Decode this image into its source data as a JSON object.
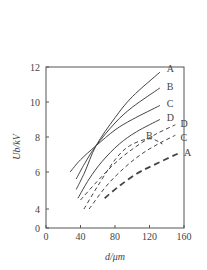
{
  "chart_data": {
    "type": "line",
    "title": "",
    "xlabel": "d/μm",
    "ylabel": "U_b/kV",
    "xlim": [
      0,
      160
    ],
    "ylim": [
      0,
      12
    ],
    "y_axis_break": "between 0 and 4",
    "grid": false,
    "legend": "inline labels at curve ends",
    "x_ticks": [
      0,
      40,
      80,
      120,
      160
    ],
    "y_ticks": [
      0,
      4,
      6,
      8,
      10,
      12
    ],
    "series": [
      {
        "name": "A",
        "style": "solid",
        "points": [
          [
            35,
            5.0
          ],
          [
            45,
            6.0
          ],
          [
            58,
            7.5
          ],
          [
            80,
            9.1
          ],
          [
            100,
            10.3
          ],
          [
            132,
            11.7
          ]
        ],
        "label_at": [
          140,
          11.9
        ]
      },
      {
        "name": "B",
        "style": "solid",
        "points": [
          [
            35,
            5.6
          ],
          [
            45,
            6.5
          ],
          [
            58,
            7.5
          ],
          [
            80,
            8.8
          ],
          [
            100,
            9.7
          ],
          [
            132,
            10.8
          ]
        ],
        "label_at": [
          140,
          10.9
        ]
      },
      {
        "name": "C",
        "style": "solid",
        "points": [
          [
            28,
            6.0
          ],
          [
            40,
            6.7
          ],
          [
            58,
            7.5
          ],
          [
            80,
            8.4
          ],
          [
            100,
            9.0
          ],
          [
            132,
            9.8
          ]
        ],
        "label_at": [
          140,
          9.9
        ]
      },
      {
        "name": "D",
        "style": "solid",
        "points": [
          [
            37,
            4.5
          ],
          [
            50,
            5.6
          ],
          [
            65,
            6.6
          ],
          [
            85,
            7.6
          ],
          [
            105,
            8.3
          ],
          [
            132,
            9.0
          ]
        ],
        "label_at": [
          140,
          9.1
        ]
      },
      {
        "name": "D",
        "style": "dashed",
        "points": [
          [
            40,
            4.4
          ],
          [
            60,
            5.5
          ],
          [
            80,
            6.5
          ],
          [
            100,
            7.3
          ],
          [
            125,
            8.1
          ],
          [
            150,
            8.7
          ]
        ],
        "label_at": [
          156,
          8.8
        ]
      },
      {
        "name": "B",
        "style": "dashed",
        "points": [
          [
            44,
            3.7
          ],
          [
            60,
            5.2
          ],
          [
            80,
            6.7
          ],
          [
            97,
            7.5
          ],
          [
            120,
            7.9
          ],
          [
            135,
            7.6
          ]
        ],
        "label_at": [
          116,
          8.1
        ]
      },
      {
        "name": "C",
        "style": "dashed",
        "points": [
          [
            50,
            3.7
          ],
          [
            70,
            5.2
          ],
          [
            90,
            6.2
          ],
          [
            110,
            7.0
          ],
          [
            130,
            7.6
          ],
          [
            150,
            8.1
          ]
        ],
        "label_at": [
          156,
          8.0
        ]
      },
      {
        "name": "A",
        "style": "dashed-bold",
        "points": [
          [
            68,
            4.5
          ],
          [
            85,
            5.2
          ],
          [
            105,
            5.9
          ],
          [
            125,
            6.4
          ],
          [
            155,
            7.1
          ]
        ],
        "label_at": [
          160,
          7.1
        ]
      }
    ]
  },
  "labels": {
    "x_axis_title": "d/μm",
    "y_axis_title": "Ub/kV"
  }
}
